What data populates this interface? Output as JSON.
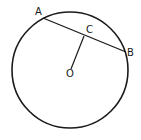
{
  "figure": {
    "stroke_color": "#1a1a1a",
    "background": "#ffffff",
    "circle": {
      "cx": 70,
      "cy": 70,
      "r": 58
    },
    "points": {
      "A": {
        "label": "A",
        "x": 43,
        "y": 18,
        "label_x": 35,
        "label_y": 15
      },
      "B": {
        "label": "B",
        "x": 126,
        "y": 52,
        "label_x": 127,
        "label_y": 56
      },
      "C": {
        "label": "C",
        "x": 84,
        "y": 35,
        "label_x": 86,
        "label_y": 33
      },
      "O": {
        "label": "O",
        "x": 70,
        "y": 73,
        "label_x": 66,
        "label_y": 77
      }
    },
    "segments": [
      {
        "name": "chord-AB",
        "from": "A",
        "to": "B"
      },
      {
        "name": "segment-OC",
        "from": "O",
        "to": "C"
      }
    ]
  }
}
